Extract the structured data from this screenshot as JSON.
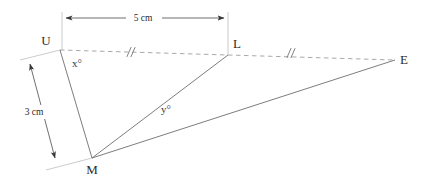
{
  "diagram": {
    "type": "geometry-figure",
    "canvas": {
      "width": 423,
      "height": 181,
      "background": "#ffffff"
    },
    "vertices": [
      {
        "id": "U",
        "label": "U",
        "x": 60,
        "y": 50,
        "label_x": 46,
        "label_y": 45
      },
      {
        "id": "L",
        "label": "L",
        "x": 228,
        "y": 55,
        "label_x": 235,
        "label_y": 48
      },
      {
        "id": "E",
        "label": "E",
        "x": 395,
        "y": 60,
        "label_x": 401,
        "label_y": 64
      },
      {
        "id": "M",
        "label": "M",
        "x": 92,
        "y": 158,
        "label_x": 88,
        "label_y": 174
      }
    ],
    "segments": [
      {
        "id": "UM",
        "from": "U",
        "to": "M",
        "style": "solid",
        "name": "segment-u-m"
      },
      {
        "id": "LM",
        "from": "L",
        "to": "M",
        "style": "solid",
        "name": "segment-l-m"
      },
      {
        "id": "EM",
        "from": "E",
        "to": "M",
        "style": "solid",
        "name": "segment-e-m"
      },
      {
        "id": "UL",
        "from": "U",
        "to": "L",
        "style": "dashed",
        "name": "segment-u-l"
      },
      {
        "id": "LE",
        "from": "L",
        "to": "E",
        "style": "dashed",
        "name": "segment-l-e"
      }
    ],
    "tick_marks": [
      {
        "id": "tick-ul",
        "on_segment": "UL",
        "count": 2,
        "x": 130,
        "y": 52,
        "angle": 1.7
      },
      {
        "id": "tick-le",
        "on_segment": "LE",
        "count": 2,
        "x": 290,
        "y": 53,
        "angle": 1.7
      }
    ],
    "angles": [
      {
        "id": "x",
        "label": "x°",
        "at_vertex": "U",
        "x": 72,
        "y": 67,
        "name": "angle-label-x"
      },
      {
        "id": "y",
        "label": "y°",
        "at_vertex": "M",
        "x": 161,
        "y": 113,
        "name": "angle-label-y"
      }
    ],
    "dimensions": [
      {
        "id": "dim-ul",
        "label": "5 cm",
        "value": 5,
        "unit": "cm",
        "measures": "UL",
        "orientation": "horizontal",
        "line": {
          "x1": 62,
          "y1": 18,
          "x2": 228,
          "y2": 18
        },
        "label_x": 143,
        "label_y": 21,
        "ext1": {
          "x1": 62,
          "y1": 12,
          "x2": 62,
          "y2": 50
        },
        "ext2": {
          "x1": 228,
          "y1": 12,
          "x2": 228,
          "y2": 55
        }
      },
      {
        "id": "dim-um",
        "label": "3 cm",
        "value": 3,
        "unit": "cm",
        "measures": "UM",
        "orientation": "diagonal",
        "line": {
          "x1": 30,
          "y1": 64,
          "x2": 55,
          "y2": 158
        },
        "label_x": 33,
        "label_y": 115,
        "ext1": {
          "x1": 60,
          "y1": 50,
          "x2": 20,
          "y2": 60
        },
        "ext2": {
          "x1": 92,
          "y1": 158,
          "x2": 46,
          "y2": 170
        }
      }
    ],
    "colors": {
      "solid_line": "#6e6e6e",
      "dashed_line": "#9a9a9a",
      "dimension_line": "#4a4a4a",
      "extension_line": "#b4b4b4",
      "text": "#2b2b2b",
      "background": "#ffffff"
    }
  }
}
